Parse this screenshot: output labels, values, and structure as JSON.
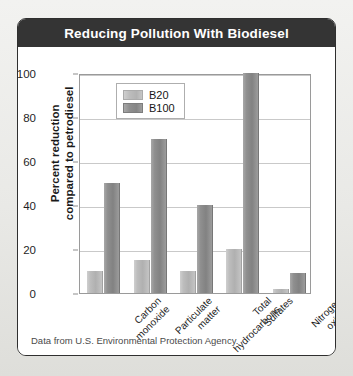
{
  "figure": {
    "title": "Reducing Pollution With Biodiesel",
    "source_note": "Data from U.S. Environmental Protection Agency."
  },
  "colors": {
    "title_bar": "#343434",
    "title_text": "#ffffff",
    "card_bg": "#ffffff",
    "card_border": "#2f2f2f",
    "page_bg": "#eeeeec",
    "b20": "#b8b8b8",
    "b100": "#8a8a8a",
    "gridline": "#c9c9c9",
    "axis": "#9a9a9a"
  },
  "chart_data": {
    "type": "bar",
    "title": "Reducing Pollution With Biodiesel",
    "xlabel": "",
    "ylabel": "Percent reduction compared to petrodiesel",
    "ylabel_lines": [
      "Percent reduction",
      "compared to petrodiesel"
    ],
    "ylim": [
      0,
      100
    ],
    "yticks": [
      0,
      20,
      40,
      60,
      80,
      100
    ],
    "ytick_labels": [
      "0",
      "20",
      "40",
      "60",
      "80",
      "100"
    ],
    "grid": true,
    "legend_position": "upper left (inside plot)",
    "categories": [
      "Carbon monoxide",
      "Particulate matter",
      "Total hydrocarbons",
      "Sulfates",
      "Nitrogen oxides"
    ],
    "category_lines": [
      [
        "Carbon",
        "monoxide"
      ],
      [
        "Particulate",
        "matter"
      ],
      [
        "Total",
        "hydrocarbons"
      ],
      [
        "Sulfates"
      ],
      [
        "Nitrogen",
        "oxides"
      ]
    ],
    "series": [
      {
        "name": "B20",
        "color": "#b8b8b8",
        "values": [
          10,
          15,
          10,
          20,
          2
        ]
      },
      {
        "name": "B100",
        "color": "#8a8a8a",
        "values": [
          50,
          70,
          40,
          100,
          9
        ]
      }
    ]
  }
}
